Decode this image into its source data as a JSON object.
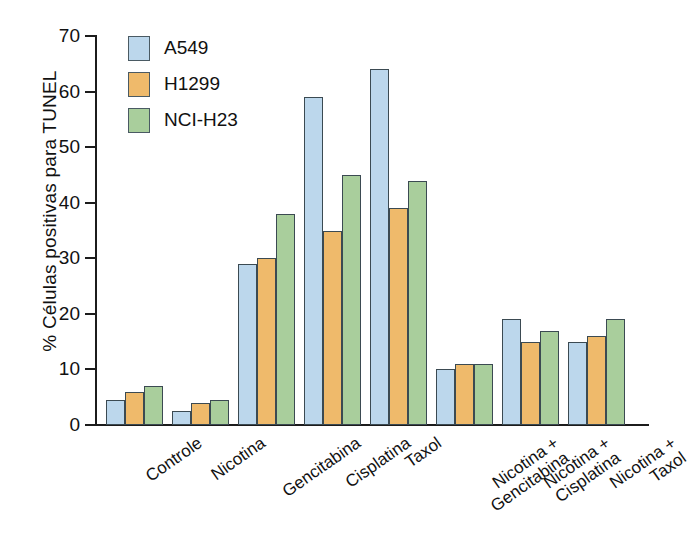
{
  "chart_data": {
    "type": "bar",
    "title": "",
    "xlabel": "",
    "ylabel": "% Células positivas para TUNEL",
    "ylim": [
      0,
      70
    ],
    "yticks": [
      0,
      10,
      20,
      30,
      40,
      50,
      60,
      70
    ],
    "grid": false,
    "legend_position": "top-left",
    "categories": [
      "Controle",
      "Nicotina",
      "Gencitabina",
      "Cisplatina",
      "Taxol",
      "Nicotina +\nGencitabina",
      "Nicotina +\nCisplatina",
      "Nicotina +\nTaxol"
    ],
    "series": [
      {
        "name": "A549",
        "color": "#bcd7ec",
        "values": [
          4.5,
          2.5,
          29,
          59,
          64,
          10,
          19,
          15
        ]
      },
      {
        "name": "H1299",
        "color": "#efba6b",
        "values": [
          6,
          4,
          30,
          35,
          39,
          11,
          15,
          16
        ]
      },
      {
        "name": "NCI-H23",
        "color": "#a9ce9c",
        "values": [
          7,
          4.5,
          38,
          45,
          44,
          11,
          17,
          19
        ]
      }
    ]
  },
  "axis": {
    "tick_labels": [
      "0",
      "10",
      "20",
      "30",
      "40",
      "50",
      "60",
      "70"
    ]
  },
  "legend": {
    "items": [
      {
        "label": "A549"
      },
      {
        "label": "H1299"
      },
      {
        "label": "NCI-H23"
      }
    ]
  }
}
